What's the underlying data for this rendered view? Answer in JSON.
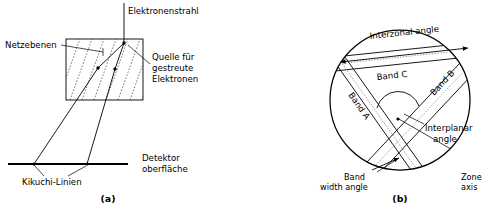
{
  "figure": {
    "panels": [
      {
        "id": "a",
        "caption": "(a)",
        "title_hidden": "Formation of Kikuchi lines",
        "labels": {
          "electron_beam": "Elektronenstrahl",
          "lattice_planes": "Netzebenen",
          "scatter_source_line1": "Quelle für",
          "scatter_source_line2": "gestreute",
          "scatter_source_line3": "Elektronen",
          "detector_line1": "Detektor",
          "detector_line2": "oberfläche",
          "kikuchi_lines": "Kikuchi-Linien"
        }
      },
      {
        "id": "b",
        "caption": "(b)",
        "title_hidden": "Kikuchi pattern angles",
        "labels": {
          "interzonal_angle": "Interzonal angle",
          "band_c": "Band C",
          "band_a": "Band A",
          "band_b": "Band B",
          "interplanar_angle_line1": "Interplanar",
          "interplanar_angle_line2": "angle",
          "band_width_line1": "Band",
          "band_width_line2": "width angle",
          "zone_axis_line1": "Zone",
          "zone_axis_line2": "axis"
        }
      }
    ],
    "colors": {
      "ink": "#000000",
      "plane_dash": "#3c3c3c",
      "centerline": "#707070",
      "background": "#ffffff"
    }
  }
}
